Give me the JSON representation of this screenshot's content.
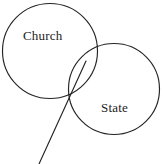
{
  "diagram": {
    "type": "venn",
    "background_color": "#ffffff",
    "stroke_color": "#242424",
    "circles": [
      {
        "id": "church",
        "label": "Church",
        "cx": 50,
        "cy": 51,
        "r": 47.5,
        "label_x": 23,
        "label_y": 29
      },
      {
        "id": "state",
        "label": "State",
        "cx": 114,
        "cy": 89,
        "r": 45.5,
        "label_x": 101,
        "label_y": 101
      }
    ],
    "line": {
      "id": "divider-line",
      "x1": 86,
      "y1": 61,
      "x2": 39,
      "y2": 164
    },
    "intersection_point": {
      "x": 69,
      "y": 97
    }
  }
}
